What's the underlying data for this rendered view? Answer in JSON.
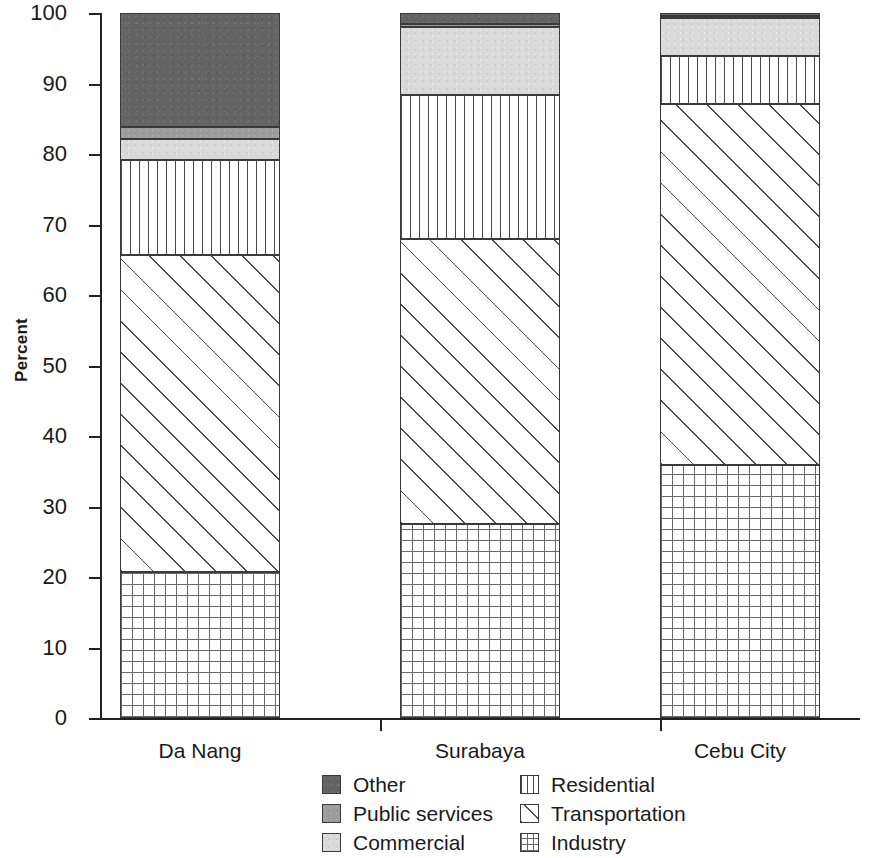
{
  "chart_data": {
    "type": "bar",
    "subtype": "stacked-bar-100-percent",
    "title": "",
    "xlabel": "",
    "ylabel": "Percent",
    "categories": [
      "Da Nang",
      "Surabaya",
      "Cebu City"
    ],
    "ylim": [
      0,
      100
    ],
    "yticks": [
      0,
      10,
      20,
      30,
      40,
      50,
      60,
      70,
      80,
      90,
      100
    ],
    "ytick_labels": [
      "0",
      "10",
      "20",
      "30",
      "40",
      "50",
      "60",
      "70",
      "80",
      "90",
      "100"
    ],
    "grid": false,
    "legend_position": "bottom",
    "stack_order_bottom_to_top": [
      "Industry",
      "Transportation",
      "Residential",
      "Commercial",
      "Public services",
      "Other"
    ],
    "series": [
      {
        "name": "Industry",
        "values": [
          20.7,
          27.5,
          35.9
        ]
      },
      {
        "name": "Transportation",
        "values": [
          45.0,
          40.5,
          51.2
        ]
      },
      {
        "name": "Residential",
        "values": [
          13.4,
          20.4,
          6.8
        ]
      },
      {
        "name": "Commercial",
        "values": [
          3.0,
          9.6,
          5.4
        ]
      },
      {
        "name": "Public services",
        "values": [
          1.7,
          0.4,
          0.3
        ]
      },
      {
        "name": "Other",
        "values": [
          16.2,
          1.6,
          0.4
        ]
      }
    ],
    "cumulative_tops": {
      "Da Nang": {
        "Industry": 20.7,
        "Transportation": 65.7,
        "Residential": 79.1,
        "Commercial": 82.1,
        "Public services": 83.8,
        "Other": 100.0
      },
      "Surabaya": {
        "Industry": 27.5,
        "Transportation": 68.0,
        "Residential": 88.4,
        "Commercial": 98.0,
        "Public services": 98.4,
        "Other": 100.0
      },
      "Cebu City": {
        "Industry": 35.9,
        "Transportation": 87.1,
        "Residential": 93.9,
        "Commercial": 99.3,
        "Public services": 99.6,
        "Other": 100.0
      }
    }
  },
  "axis": {
    "y_label": "Percent",
    "ticks": [
      {
        "value": 100,
        "label": "100"
      },
      {
        "value": 90,
        "label": "90"
      },
      {
        "value": 80,
        "label": "80"
      },
      {
        "value": 70,
        "label": "70"
      },
      {
        "value": 60,
        "label": "60"
      },
      {
        "value": 50,
        "label": "50"
      },
      {
        "value": 40,
        "label": "40"
      },
      {
        "value": 30,
        "label": "30"
      },
      {
        "value": 20,
        "label": "20"
      },
      {
        "value": 10,
        "label": "10"
      },
      {
        "value": 0,
        "label": "0"
      }
    ],
    "x_categories": [
      {
        "label": "Da Nang"
      },
      {
        "label": "Surabaya"
      },
      {
        "label": "Cebu City"
      }
    ]
  },
  "legend": {
    "left_column": [
      {
        "label": "Other",
        "swatch": "other-swatch",
        "fill": "fill-other",
        "color": "#646464"
      },
      {
        "label": "Public services",
        "swatch": "public-services-swatch",
        "fill": "fill-public",
        "color": "#9c9c9c"
      },
      {
        "label": "Commercial",
        "swatch": "commercial-swatch",
        "fill": "fill-commercial",
        "color": "#d9d9d9"
      }
    ],
    "right_column": [
      {
        "label": "Residential",
        "swatch": "residential-swatch",
        "fill": "fill-residential",
        "color": "#ffffff"
      },
      {
        "label": "Transportation",
        "swatch": "transportation-swatch",
        "fill": "fill-transportation",
        "color": "#ffffff"
      },
      {
        "label": "Industry",
        "swatch": "industry-swatch",
        "fill": "fill-industry",
        "color": "#ffffff"
      }
    ]
  }
}
